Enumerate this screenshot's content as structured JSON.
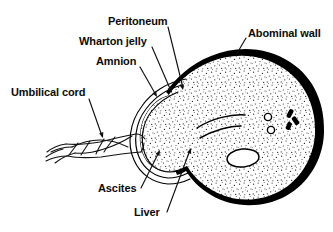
{
  "figure": {
    "background_color": "#ffffff",
    "ink_color": "#000000",
    "width": 333,
    "height": 232
  },
  "labels": [
    {
      "id": "peritoneum",
      "text": "Peritoneum",
      "x": 108,
      "y": 25,
      "anchor": "start",
      "leader": "M 168 27 L 183 88",
      "arrow": {
        "x": 183,
        "y": 90,
        "angle": 76
      }
    },
    {
      "id": "wharton-jelly",
      "text": "Wharton jelly",
      "x": 79,
      "y": 45,
      "anchor": "start",
      "leader": "M 152 47 L 171 91",
      "arrow": {
        "x": 172,
        "y": 93,
        "angle": 66
      }
    },
    {
      "id": "amnion",
      "text": "Amnion",
      "x": 96,
      "y": 65,
      "anchor": "start",
      "leader": "M 140 67 L 156 95",
      "arrow": {
        "x": 157,
        "y": 97,
        "angle": 60
      }
    },
    {
      "id": "umbilical-cord",
      "text": "Umbilical cord",
      "x": 11,
      "y": 96,
      "anchor": "start",
      "leader": "M 89 99 L 102 136",
      "arrow": {
        "x": 103,
        "y": 138,
        "angle": 71
      }
    },
    {
      "id": "abominal-wall",
      "text": "Abominal wall",
      "x": 248,
      "y": 37,
      "anchor": "start",
      "leader": "M 246 38 L 236 55",
      "arrow": {
        "x": 235,
        "y": 57,
        "angle": 120
      }
    },
    {
      "id": "ascites",
      "text": "Ascites",
      "x": 98,
      "y": 192,
      "anchor": "start",
      "leader": "M 141 188 L 159 152",
      "arrow": {
        "x": 160,
        "y": 150,
        "angle": -63
      }
    },
    {
      "id": "liver",
      "text": "Liver",
      "x": 134,
      "y": 216,
      "anchor": "start",
      "leader": "M 167 212 L 190 150",
      "arrow": {
        "x": 191,
        "y": 148,
        "angle": -70
      }
    }
  ],
  "anatomy": {
    "abdominal_wall": {
      "name": "abdominal-wall",
      "fill": "#000000",
      "description": "thick black crescent forming the outer body wall"
    },
    "cavity": {
      "name": "abdominal-cavity",
      "fill": "#ffffff",
      "stipple": true,
      "description": "stippled region representing ascitic fluid and liver"
    },
    "membranes": {
      "count": 3,
      "names": [
        "peritoneum",
        "wharton-jelly",
        "amnion"
      ]
    },
    "cord": {
      "name": "umbilical-cord",
      "description": "twisted cord with spiral vessels exiting to the left"
    },
    "vessel_circles": [
      {
        "cx": 268,
        "cy": 117,
        "r": 3.6
      },
      {
        "cx": 271,
        "cy": 130,
        "r": 3.6
      }
    ],
    "bowel_loops": [
      {
        "cx": 290,
        "cy": 114,
        "w": 4.5,
        "h": 8,
        "angle": 28
      },
      {
        "cx": 296,
        "cy": 121,
        "w": 4.5,
        "h": 8,
        "angle": -35
      },
      {
        "cx": 289,
        "cy": 126,
        "w": 4.5,
        "h": 7,
        "angle": 20
      }
    ],
    "oval": {
      "cx": 243,
      "cy": 158,
      "rx": 16,
      "ry": 9,
      "angle": -6
    },
    "arcs": [
      "M 197 128 C 212 118 232 114 245 115",
      "M 200 138 C 214 130 230 126 241 126"
    ]
  }
}
